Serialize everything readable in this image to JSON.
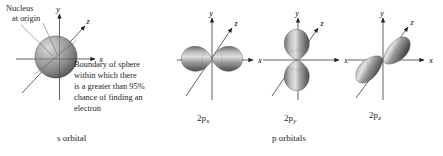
{
  "figure": {
    "background_color": "#ffffff",
    "ink_color": "#231f20",
    "callouts": {
      "nucleus_line1": "Nucleus",
      "nucleus_line2": "at origin",
      "boundary_note": "Boundary of sphere\nwithin which there\nis a greater than 95%\nchance of finding an\nelectron"
    },
    "captions": {
      "s_orbital": "s orbital",
      "p_orbitals": "p orbitals"
    },
    "axes": {
      "x_label": "x",
      "y_label": "y",
      "z_label": "z"
    },
    "orbitals": [
      {
        "id": "s",
        "label_main": "",
        "label_sub": "",
        "caption": "s orbital",
        "shape": "sphere",
        "axis_labels": [
          "y",
          "z",
          "x"
        ],
        "fill_color": "#8c8c8c"
      },
      {
        "id": "2px",
        "label_main": "2p",
        "label_sub": "x",
        "shape": "two-lobes",
        "lobe_axis": "x",
        "axis_labels": [
          "y",
          "z",
          "x"
        ],
        "fill_color": "#8c8c8c"
      },
      {
        "id": "2py",
        "label_main": "2p",
        "label_sub": "y",
        "shape": "two-lobes",
        "lobe_axis": "y",
        "axis_labels": [
          "y",
          "z",
          "x"
        ],
        "fill_color": "#8c8c8c"
      },
      {
        "id": "2pz",
        "label_main": "2p",
        "label_sub": "z",
        "shape": "two-lobes",
        "lobe_axis": "z",
        "axis_labels": [
          "y",
          "z",
          "x"
        ],
        "fill_color": "#8c8c8c"
      }
    ]
  }
}
